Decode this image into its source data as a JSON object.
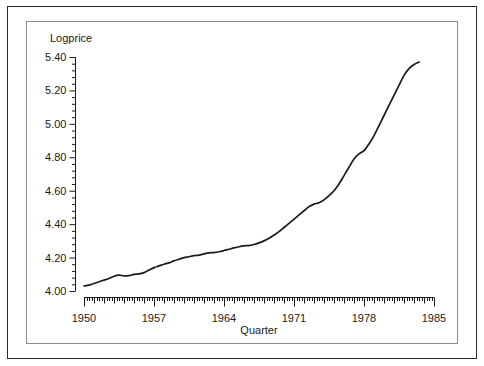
{
  "figure": {
    "background_color": "#ffffff",
    "outer_border_color": "#2b2b2b",
    "inner_border_color": "#8c8c8c",
    "line_color": "#1a1a1a",
    "text_color": "#1a1a1a"
  },
  "chart_data": {
    "type": "line",
    "title": "",
    "ylabel": "Logprice",
    "xlabel": "Quarter",
    "ylim": [
      4.0,
      5.4
    ],
    "xlim": [
      1950,
      1985
    ],
    "grid": false,
    "legend": false,
    "y_ticks": [
      "4.00",
      "4.20",
      "4.40",
      "4.60",
      "4.80",
      "5.00",
      "5.20",
      "5.40"
    ],
    "y_tick_values": [
      4.0,
      4.2,
      4.4,
      4.6,
      4.8,
      5.0,
      5.2,
      5.4
    ],
    "y_minor_step": 0.04,
    "x_ticks": [
      "1950",
      "1957",
      "1964",
      "1971",
      "1978",
      "1985"
    ],
    "x_tick_values": [
      1950,
      1957,
      1964,
      1971,
      1978,
      1985
    ],
    "x_minor_step": 0.25,
    "x_major_step": 1,
    "series": [
      {
        "name": "Logprice",
        "x": [
          1950.0,
          1950.5,
          1951.0,
          1951.5,
          1952.0,
          1952.5,
          1953.0,
          1953.5,
          1954.0,
          1954.5,
          1955.0,
          1955.5,
          1956.0,
          1956.5,
          1957.0,
          1957.5,
          1958.0,
          1958.5,
          1959.0,
          1959.5,
          1960.0,
          1960.5,
          1961.0,
          1961.5,
          1962.0,
          1962.5,
          1963.0,
          1963.5,
          1964.0,
          1964.5,
          1965.0,
          1965.5,
          1966.0,
          1966.5,
          1967.0,
          1967.5,
          1968.0,
          1968.5,
          1969.0,
          1969.5,
          1970.0,
          1970.5,
          1971.0,
          1971.5,
          1972.0,
          1972.5,
          1973.0,
          1973.5,
          1974.0,
          1974.5,
          1975.0,
          1975.5,
          1976.0,
          1976.5,
          1977.0,
          1977.5,
          1978.0,
          1978.5,
          1979.0,
          1979.5,
          1980.0,
          1980.5,
          1981.0,
          1981.5,
          1982.0,
          1982.5,
          1983.0,
          1983.5
        ],
        "y": [
          4.03,
          4.035,
          4.045,
          4.055,
          4.065,
          4.075,
          4.088,
          4.095,
          4.09,
          4.092,
          4.1,
          4.102,
          4.11,
          4.125,
          4.14,
          4.15,
          4.16,
          4.168,
          4.18,
          4.19,
          4.2,
          4.205,
          4.212,
          4.215,
          4.222,
          4.228,
          4.23,
          4.235,
          4.242,
          4.25,
          4.258,
          4.265,
          4.27,
          4.272,
          4.278,
          4.288,
          4.3,
          4.315,
          4.335,
          4.355,
          4.38,
          4.405,
          4.43,
          4.455,
          4.48,
          4.505,
          4.52,
          4.528,
          4.545,
          4.57,
          4.6,
          4.64,
          4.69,
          4.74,
          4.79,
          4.82,
          4.84,
          4.88,
          4.93,
          4.99,
          5.05,
          5.11,
          5.17,
          5.23,
          5.29,
          5.33,
          5.355,
          5.37
        ]
      }
    ]
  }
}
